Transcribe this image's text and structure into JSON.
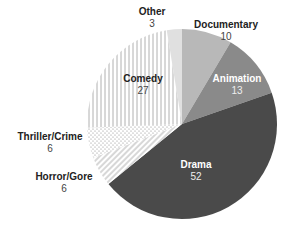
{
  "chart_data": {
    "type": "pie",
    "title": "",
    "start_angle_deg": 0,
    "direction": "clockwise",
    "total": 117,
    "slices": [
      {
        "label": "Documentary",
        "value": 10,
        "fill": "#b8b8b8",
        "pattern": "solid"
      },
      {
        "label": "Animation",
        "value": 13,
        "fill": "#8a8a8a",
        "pattern": "solid"
      },
      {
        "label": "Drama",
        "value": 52,
        "fill": "#4a4a4a",
        "pattern": "solid"
      },
      {
        "label": "Horror/Gore",
        "value": 6,
        "fill": "#ffffff",
        "pattern": "diagonal-lines"
      },
      {
        "label": "Thriller/Crime",
        "value": 6,
        "fill": "#ffffff",
        "pattern": "dots"
      },
      {
        "label": "Comedy",
        "value": 27,
        "fill": "#ffffff",
        "pattern": "vertical-lines"
      },
      {
        "label": "Other",
        "value": 3,
        "fill": "#e0e0e0",
        "pattern": "solid"
      }
    ]
  },
  "labels": {
    "documentary": {
      "name": "Documentary",
      "value": "10"
    },
    "animation": {
      "name": "Animation",
      "value": "13"
    },
    "drama": {
      "name": "Drama",
      "value": "52"
    },
    "horror": {
      "name": "Horror/Gore",
      "value": "6"
    },
    "thriller": {
      "name": "Thriller/Crime",
      "value": "6"
    },
    "comedy": {
      "name": "Comedy",
      "value": "27"
    },
    "other": {
      "name": "Other",
      "value": "3"
    }
  }
}
